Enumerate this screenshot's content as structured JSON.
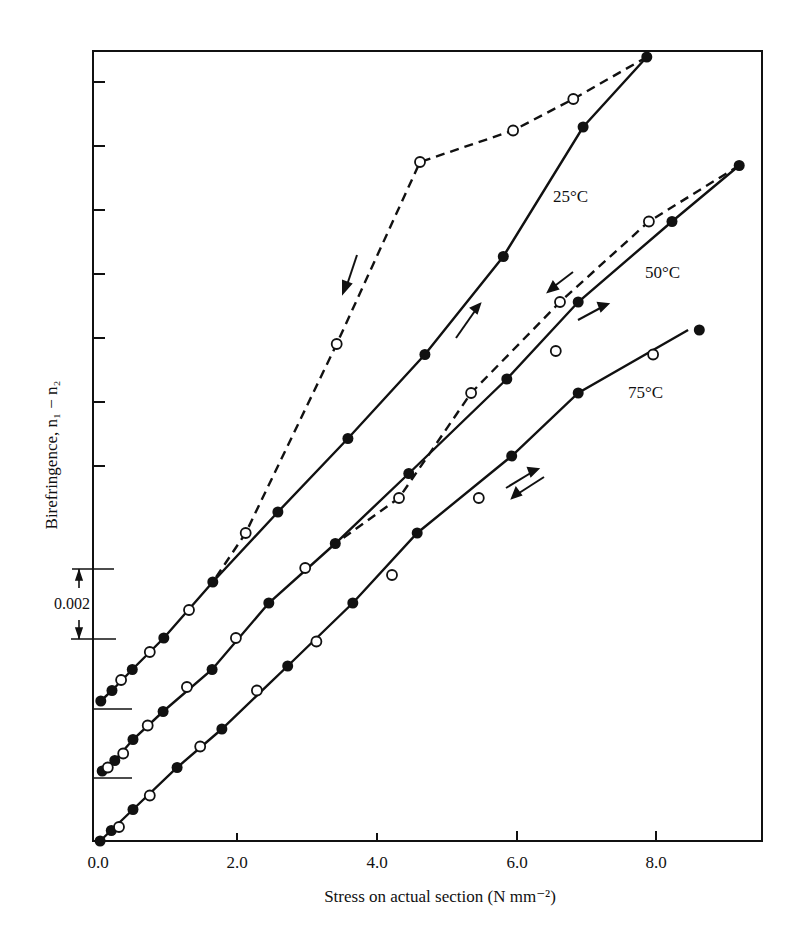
{
  "chart_data": {
    "type": "line",
    "title": "",
    "xlabel": "Stress on actual section (N mm⁻²)",
    "ylabel": "Birefringence, n₁ − n₂",
    "xlim": [
      0,
      9.5
    ],
    "x_ticks": [
      "0.0",
      "2.0",
      "4.0",
      "6.0",
      "8.0"
    ],
    "x_tick_values": [
      0,
      2,
      4,
      6,
      8
    ],
    "grid": false,
    "legend": "none (curves labelled inline)",
    "scale_bar": {
      "label": "0.002",
      "value": 0.002
    },
    "note": "Curves offset vertically by 0.002 each; birefringence values relative to each curve's own origin",
    "series": [
      {
        "name": "25°C",
        "offset": 0.004,
        "loading": [
          [
            0.04,
            0.0
          ],
          [
            0.2,
            0.0003
          ],
          [
            0.49,
            0.0009
          ],
          [
            0.94,
            0.0018
          ],
          [
            1.64,
            0.0034
          ],
          [
            2.57,
            0.0054
          ],
          [
            3.57,
            0.0075
          ],
          [
            4.67,
            0.0099
          ],
          [
            5.79,
            0.0127
          ],
          [
            6.93,
            0.0164
          ],
          [
            7.84,
            0.0184
          ]
        ],
        "unloading": [
          [
            7.84,
            0.0184
          ],
          [
            6.79,
            0.0172
          ],
          [
            5.93,
            0.0163
          ],
          [
            4.6,
            0.0154
          ],
          [
            3.41,
            0.0102
          ],
          [
            2.11,
            0.0048
          ],
          [
            1.64,
            0.0034
          ]
        ],
        "open_markers": [
          [
            0.33,
            0.0006
          ],
          [
            0.74,
            0.0014
          ],
          [
            1.3,
            0.0026
          ],
          [
            2.11,
            0.0048
          ],
          [
            3.41,
            0.0102
          ],
          [
            4.6,
            0.0154
          ],
          [
            5.93,
            0.0163
          ],
          [
            6.79,
            0.0172
          ]
        ],
        "filled_markers": [
          [
            0.04,
            0.0
          ],
          [
            0.2,
            0.0003
          ],
          [
            0.49,
            0.0009
          ],
          [
            0.94,
            0.0018
          ],
          [
            1.64,
            0.0034
          ],
          [
            2.57,
            0.0054
          ],
          [
            3.57,
            0.0075
          ],
          [
            4.67,
            0.0099
          ],
          [
            5.79,
            0.0127
          ],
          [
            6.93,
            0.0164
          ],
          [
            7.84,
            0.0184
          ]
        ]
      },
      {
        "name": "50°C",
        "offset": 0.002,
        "loading": [
          [
            0.06,
            0.0
          ],
          [
            0.24,
            0.0003
          ],
          [
            0.5,
            0.0009
          ],
          [
            0.93,
            0.0017
          ],
          [
            1.63,
            0.0029
          ],
          [
            2.44,
            0.0048
          ],
          [
            3.39,
            0.0065
          ],
          [
            4.44,
            0.0085
          ],
          [
            5.84,
            0.0112
          ],
          [
            6.86,
            0.0134
          ],
          [
            8.2,
            0.0157
          ],
          [
            9.16,
            0.0173
          ]
        ],
        "unloading": [
          [
            9.16,
            0.0173
          ],
          [
            7.87,
            0.0157
          ],
          [
            6.6,
            0.0134
          ],
          [
            5.33,
            0.0108
          ],
          [
            4.3,
            0.0078
          ],
          [
            3.39,
            0.0065
          ]
        ],
        "open_markers": [
          [
            0.14,
            0.0001
          ],
          [
            0.36,
            0.0005
          ],
          [
            0.71,
            0.0013
          ],
          [
            1.27,
            0.0024
          ],
          [
            1.97,
            0.0038
          ],
          [
            2.96,
            0.0058
          ],
          [
            4.3,
            0.0078
          ],
          [
            5.33,
            0.0108
          ],
          [
            6.6,
            0.0134
          ],
          [
            7.87,
            0.0157
          ]
        ],
        "filled_markers": [
          [
            0.06,
            0.0
          ],
          [
            0.24,
            0.0003
          ],
          [
            0.5,
            0.0009
          ],
          [
            0.93,
            0.0017
          ],
          [
            1.63,
            0.0029
          ],
          [
            2.44,
            0.0048
          ],
          [
            3.39,
            0.0065
          ],
          [
            4.44,
            0.0085
          ],
          [
            5.84,
            0.0112
          ],
          [
            6.86,
            0.0134
          ],
          [
            8.2,
            0.0157
          ],
          [
            9.16,
            0.0173
          ]
        ]
      },
      {
        "name": "75°C",
        "offset": 0.0,
        "loading": [
          [
            0.03,
            0.0
          ],
          [
            0.5,
            0.0009
          ],
          [
            1.13,
            0.0021
          ],
          [
            1.77,
            0.0032
          ],
          [
            2.71,
            0.005
          ],
          [
            3.64,
            0.0068
          ],
          [
            4.56,
            0.0088
          ],
          [
            5.91,
            0.011
          ],
          [
            6.86,
            0.0128
          ],
          [
            8.43,
            0.0146
          ]
        ],
        "unloading": [],
        "open_markers": [
          [
            0.3,
            0.0004
          ],
          [
            0.74,
            0.0013
          ],
          [
            1.46,
            0.0027
          ],
          [
            2.27,
            0.0043
          ],
          [
            3.12,
            0.0057
          ],
          [
            4.2,
            0.0076
          ],
          [
            5.44,
            0.0098
          ],
          [
            6.54,
            0.014
          ],
          [
            7.93,
            0.0139
          ]
        ],
        "filled_markers": [
          [
            0.03,
            0.0
          ],
          [
            0.19,
            0.0003
          ],
          [
            0.5,
            0.0009
          ],
          [
            1.13,
            0.0021
          ],
          [
            1.77,
            0.0032
          ],
          [
            2.71,
            0.005
          ],
          [
            3.64,
            0.0068
          ],
          [
            4.56,
            0.0088
          ],
          [
            5.91,
            0.011
          ],
          [
            6.86,
            0.0128
          ],
          [
            8.59,
            0.0146
          ]
        ]
      }
    ]
  },
  "labels": {
    "x_ticks": [
      "0.0",
      "2.0",
      "4.0",
      "6.0",
      "8.0"
    ],
    "xlabel": "Stress on actual section (N mm⁻²)",
    "ylabel": "Birefringence, n₁ − n₂",
    "scale_bar": "0.002",
    "curve_25": "25°C",
    "curve_50": "50°C",
    "curve_75": "75°C"
  },
  "colors": {
    "ink": "#111111",
    "background": "#ffffff"
  }
}
